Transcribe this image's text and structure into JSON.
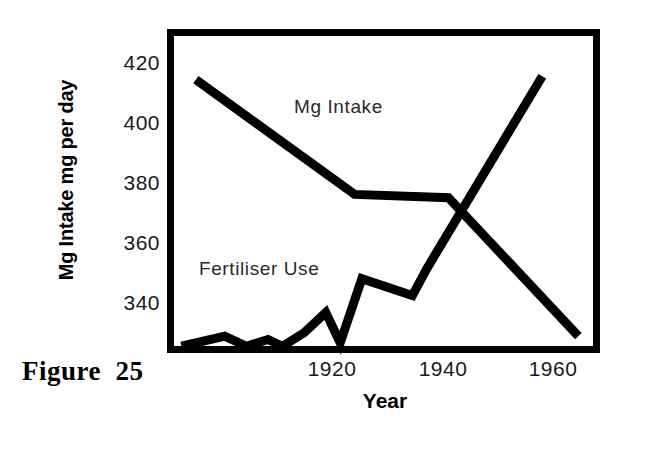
{
  "figure": {
    "caption": "Figure  25"
  },
  "chart_data": {
    "type": "line",
    "title": "",
    "xlabel": "Year",
    "ylabel": "Mg Intake mg per day",
    "xlim": [
      1905,
      1965
    ],
    "ylim": [
      328,
      424
    ],
    "grid": false,
    "legend_position": "inline-annotations",
    "xticks": [
      "1920",
      "1940",
      "1960"
    ],
    "xtick_values": [
      1920,
      1940,
      1960
    ],
    "yticks": [
      "340",
      "360",
      "380",
      "400",
      "420"
    ],
    "ytick_values": [
      340,
      360,
      380,
      400,
      420
    ],
    "series": [
      {
        "name": "Mg Intake",
        "annotation": "Mg Intake",
        "color": "#000000",
        "x": [
          1909,
          1931,
          1944,
          1962
        ],
        "values": [
          409,
          375,
          374,
          333
        ]
      },
      {
        "name": "Fertiliser Use",
        "annotation": "Fertiliser Use",
        "color": "#000000",
        "x": [
          1907,
          1913,
          1916,
          1919,
          1921,
          1924,
          1927,
          1929,
          1932,
          1939,
          1941,
          1957
        ],
        "values": [
          330,
          333,
          330,
          332,
          330,
          334,
          340,
          331,
          350,
          345,
          353,
          410
        ]
      }
    ]
  },
  "axes": {
    "ytick_labels": [
      {
        "text": "420",
        "top": 52
      },
      {
        "text": "400",
        "top": 112
      },
      {
        "text": "380",
        "top": 172
      },
      {
        "text": "360",
        "top": 232
      },
      {
        "text": "340",
        "top": 292
      }
    ],
    "xtick_labels": [
      {
        "text": "1920",
        "left": 292
      },
      {
        "text": "1940",
        "left": 403
      },
      {
        "text": "1960",
        "left": 513
      }
    ]
  }
}
